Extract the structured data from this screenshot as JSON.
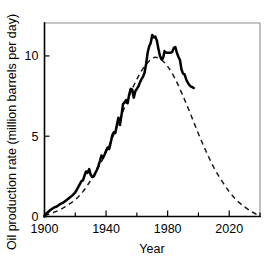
{
  "chart_data": {
    "type": "line",
    "title": "",
    "xlabel": "Year",
    "ylabel": "Oil production rate (million barrels per day)",
    "xlim": [
      1900,
      2040
    ],
    "ylim": [
      0,
      12.05
    ],
    "grid": false,
    "legend": "none",
    "x_major_ticks": [
      1900,
      1940,
      1980,
      2020
    ],
    "x_major_ticklabels": [
      "1900",
      "1940",
      "1980",
      "2020"
    ],
    "x_minor_ticks": [
      1920,
      1960,
      2000,
      2040
    ],
    "y_major_ticks": [
      0,
      5,
      10
    ],
    "y_major_ticklabels": [
      "0",
      "5",
      "10"
    ],
    "series": [
      {
        "name": "Actual production",
        "style": "solid",
        "color": "#000000",
        "points": [
          [
            1900,
            0.05
          ],
          [
            1902,
            0.25
          ],
          [
            1904,
            0.42
          ],
          [
            1906,
            0.55
          ],
          [
            1908,
            0.62
          ],
          [
            1910,
            0.77
          ],
          [
            1912,
            0.85
          ],
          [
            1914,
            1.0
          ],
          [
            1916,
            1.15
          ],
          [
            1918,
            1.3
          ],
          [
            1920,
            1.5
          ],
          [
            1922,
            1.85
          ],
          [
            1924,
            2.2
          ],
          [
            1925,
            2.25
          ],
          [
            1926,
            2.55
          ],
          [
            1927,
            2.8
          ],
          [
            1928,
            2.72
          ],
          [
            1929,
            2.95
          ],
          [
            1930,
            2.6
          ],
          [
            1931,
            2.45
          ],
          [
            1932,
            2.5
          ],
          [
            1933,
            2.7
          ],
          [
            1934,
            2.9
          ],
          [
            1935,
            3.15
          ],
          [
            1936,
            3.45
          ],
          [
            1937,
            3.8
          ],
          [
            1938,
            3.65
          ],
          [
            1939,
            3.85
          ],
          [
            1940,
            4.1
          ],
          [
            1941,
            4.3
          ],
          [
            1942,
            4.2
          ],
          [
            1943,
            4.6
          ],
          [
            1944,
            5.05
          ],
          [
            1945,
            5.25
          ],
          [
            1946,
            5.2
          ],
          [
            1947,
            5.7
          ],
          [
            1948,
            6.15
          ],
          [
            1949,
            5.7
          ],
          [
            1950,
            6.3
          ],
          [
            1951,
            7.0
          ],
          [
            1952,
            7.1
          ],
          [
            1953,
            7.25
          ],
          [
            1954,
            7.05
          ],
          [
            1955,
            7.6
          ],
          [
            1956,
            7.95
          ],
          [
            1957,
            7.9
          ],
          [
            1958,
            7.4
          ],
          [
            1959,
            7.8
          ],
          [
            1960,
            7.95
          ],
          [
            1961,
            8.1
          ],
          [
            1962,
            8.35
          ],
          [
            1963,
            8.55
          ],
          [
            1964,
            8.7
          ],
          [
            1965,
            8.95
          ],
          [
            1966,
            9.5
          ],
          [
            1967,
            10.2
          ],
          [
            1968,
            10.6
          ],
          [
            1969,
            10.8
          ],
          [
            1970,
            11.3
          ],
          [
            1971,
            11.15
          ],
          [
            1972,
            11.2
          ],
          [
            1973,
            10.95
          ],
          [
            1974,
            10.45
          ],
          [
            1975,
            10.0
          ],
          [
            1976,
            9.8
          ],
          [
            1977,
            9.85
          ],
          [
            1978,
            10.3
          ],
          [
            1979,
            10.2
          ],
          [
            1980,
            10.2
          ],
          [
            1981,
            10.2
          ],
          [
            1982,
            10.2
          ],
          [
            1983,
            10.25
          ],
          [
            1984,
            10.5
          ],
          [
            1985,
            10.55
          ],
          [
            1986,
            10.2
          ],
          [
            1987,
            9.95
          ],
          [
            1988,
            9.75
          ],
          [
            1989,
            9.15
          ],
          [
            1990,
            8.9
          ],
          [
            1991,
            8.85
          ],
          [
            1992,
            8.55
          ],
          [
            1993,
            8.35
          ],
          [
            1994,
            8.2
          ],
          [
            1995,
            8.1
          ],
          [
            1996,
            8.05
          ],
          [
            1997,
            8.0
          ]
        ]
      },
      {
        "name": "Hubbert curve fit",
        "style": "dashed",
        "color": "#1b1b1b",
        "points": [
          [
            1900,
            0.05
          ],
          [
            1905,
            0.22
          ],
          [
            1910,
            0.42
          ],
          [
            1915,
            0.7
          ],
          [
            1920,
            1.05
          ],
          [
            1925,
            1.55
          ],
          [
            1930,
            2.25
          ],
          [
            1935,
            3.05
          ],
          [
            1940,
            4.0
          ],
          [
            1945,
            5.1
          ],
          [
            1950,
            6.3
          ],
          [
            1955,
            7.5
          ],
          [
            1960,
            8.55
          ],
          [
            1965,
            9.35
          ],
          [
            1970,
            9.85
          ],
          [
            1973,
            9.9
          ],
          [
            1976,
            9.75
          ],
          [
            1980,
            9.35
          ],
          [
            1985,
            8.55
          ],
          [
            1990,
            7.5
          ],
          [
            1995,
            6.35
          ],
          [
            2000,
            5.15
          ],
          [
            2005,
            4.05
          ],
          [
            2010,
            3.05
          ],
          [
            2015,
            2.25
          ],
          [
            2020,
            1.55
          ],
          [
            2025,
            1.0
          ],
          [
            2030,
            0.6
          ],
          [
            2035,
            0.28
          ],
          [
            2040,
            0.02
          ]
        ]
      }
    ]
  }
}
